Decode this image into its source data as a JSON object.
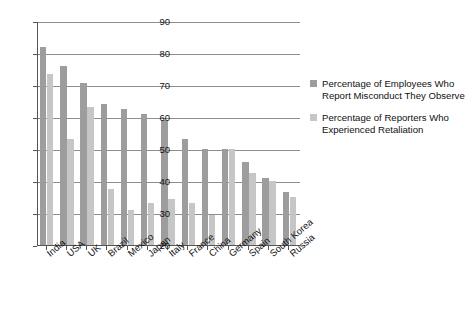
{
  "chart_data": {
    "type": "bar",
    "title": "",
    "subtitle": "",
    "xlabel": "",
    "ylabel": "",
    "ylim": [
      20,
      90
    ],
    "ytick_step": 10,
    "yticks": [
      20,
      30,
      40,
      50,
      60,
      70,
      80,
      90
    ],
    "grid": true,
    "grid_axis": "y",
    "legend_position": "right",
    "orientation": "vertical",
    "categories": [
      "India",
      "USA",
      "UK",
      "Brazil",
      "Mexico",
      "Japan",
      "Italy",
      "France",
      "China",
      "Germany",
      "Spain",
      "South Korea",
      "Russia"
    ],
    "series": [
      {
        "name": "Percentage of Employees Who Report Misconduct They Observe",
        "color": "#9d9d9d",
        "values": [
          82,
          76,
          70.5,
          64,
          62.5,
          61,
          59,
          53,
          50,
          50,
          46,
          41,
          36.5
        ]
      },
      {
        "name": "Percentage of Reporters Who Experienced Retaliation",
        "color": "#c6c6c6",
        "values": [
          73.5,
          53,
          63,
          37.5,
          31,
          33,
          34.5,
          33,
          29.5,
          50,
          42.5,
          40,
          35
        ]
      }
    ]
  },
  "legend": {
    "entries": [
      {
        "line1": "Percentage of Employees Who",
        "line2": "Report Misconduct They Observe"
      },
      {
        "line1": "Percentage of Reporters Who",
        "line2": "Experienced Retaliation"
      }
    ]
  }
}
